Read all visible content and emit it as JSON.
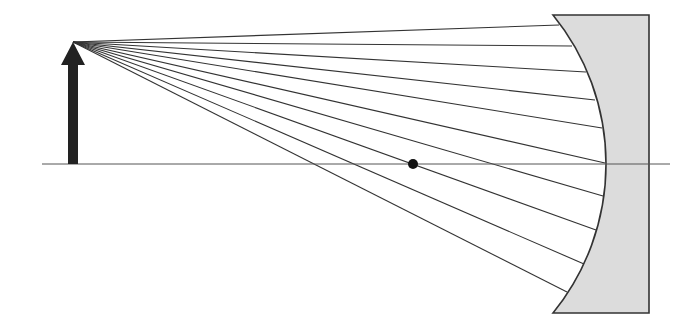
{
  "diagram": {
    "type": "concave-mirror-ray-diagram",
    "colors": {
      "background": "#ffffff",
      "line": "#333333",
      "axis": "#555555",
      "object_arrow": "#222222",
      "mirror_fill": "#dcdcdc",
      "mirror_stroke": "#333333",
      "focal_point": "#111111"
    },
    "optical_axis": {
      "x1": 42,
      "x2": 670,
      "y": 164
    },
    "object_arrow": {
      "x": 73,
      "base_y": 164,
      "tip_y": 42,
      "shaft_width": 10,
      "head_width": 24,
      "head_height": 23
    },
    "ray_origin": {
      "x": 73,
      "y": 42
    },
    "rays": [
      {
        "x2": 559,
        "y2": 25
      },
      {
        "x2": 572,
        "y2": 46
      },
      {
        "x2": 586,
        "y2": 72
      },
      {
        "x2": 595,
        "y2": 100
      },
      {
        "x2": 602,
        "y2": 128
      },
      {
        "x2": 605,
        "y2": 163
      },
      {
        "x2": 603,
        "y2": 196
      },
      {
        "x2": 596,
        "y2": 230
      },
      {
        "x2": 584,
        "y2": 264
      },
      {
        "x2": 567,
        "y2": 292
      }
    ],
    "mirror": {
      "top_left": {
        "x": 553,
        "y": 15
      },
      "vertex": {
        "x": 606,
        "y": 164
      },
      "bottom_left": {
        "x": 553,
        "y": 313
      },
      "right_x": 649
    },
    "focal_point": {
      "x": 413,
      "y": 164,
      "r": 5
    }
  }
}
